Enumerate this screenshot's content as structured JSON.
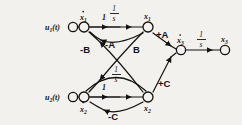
{
  "diagram": {
    "type": "signal-flow-graph",
    "background_color": "#f3f1ee",
    "ink_color": "#121212",
    "inputs": [
      {
        "id": "u1",
        "label": "u",
        "subscript": "1",
        "suffix": "(t)",
        "x": 70,
        "y": 27
      },
      {
        "id": "u2",
        "label": "u",
        "subscript": "2",
        "suffix": "(t)",
        "x": 70,
        "y": 97
      }
    ],
    "nodes": [
      {
        "id": "xd1",
        "label": "x",
        "subscript": "1",
        "dot": true,
        "x": 84,
        "y": 27,
        "label_pos": "above"
      },
      {
        "id": "x1",
        "label": "x",
        "subscript": "1",
        "dot": false,
        "x": 148,
        "y": 27,
        "label_pos": "above"
      },
      {
        "id": "xd2",
        "label": "x",
        "subscript": "2",
        "dot": true,
        "x": 84,
        "y": 97,
        "label_pos": "below"
      },
      {
        "id": "x2",
        "label": "x",
        "subscript": "2",
        "dot": false,
        "x": 148,
        "y": 97,
        "label_pos": "below"
      },
      {
        "id": "xd3",
        "label": "x",
        "subscript": "3",
        "dot": true,
        "x": 180,
        "y": 50,
        "label_pos": "above"
      },
      {
        "id": "x3",
        "label": "x",
        "subscript": "3",
        "dot": false,
        "x": 225,
        "y": 50,
        "label_pos": "above"
      }
    ],
    "edges": [
      {
        "id": "u1-xd1",
        "from": "u1",
        "to": "xd1",
        "gain": "1",
        "kind": "straight"
      },
      {
        "id": "u2-xd2",
        "from": "u2",
        "to": "xd2",
        "gain": "1",
        "kind": "straight"
      },
      {
        "id": "xd1-x1",
        "from": "xd1",
        "to": "x1",
        "gain": "1/s",
        "kind": "straight"
      },
      {
        "id": "xd2-x2",
        "from": "xd2",
        "to": "x2",
        "gain": "1/s",
        "kind": "straight"
      },
      {
        "id": "xd3-x3",
        "from": "xd3",
        "to": "x3",
        "gain": "1/s",
        "kind": "straight"
      },
      {
        "id": "x1-xd1",
        "from": "x1",
        "to": "xd1",
        "gain": "-A",
        "kind": "curve-above"
      },
      {
        "id": "x1-xd2",
        "from": "x1",
        "to": "xd2",
        "gain": "-B",
        "kind": "cross-down"
      },
      {
        "id": "x2-xd1",
        "from": "x2",
        "to": "xd1",
        "gain": "B",
        "kind": "cross-up"
      },
      {
        "id": "x2-xd2",
        "from": "x2",
        "to": "xd2",
        "gain": "-C",
        "kind": "curve-below"
      },
      {
        "id": "x1-xd3",
        "from": "x1",
        "to": "xd3",
        "gain": "+A",
        "kind": "diag-down"
      },
      {
        "id": "x2-xd3",
        "from": "x2",
        "to": "xd3",
        "gain": "+C",
        "kind": "diag-up"
      },
      {
        "id": "xd2-loop",
        "from": "xd2",
        "to": "xd2",
        "gain": "1/s",
        "kind": "arc-upper"
      }
    ],
    "gain_labels": [
      {
        "id": "g-u1",
        "text": "1",
        "x": 104,
        "y": 20
      },
      {
        "id": "g-u2",
        "text": "1",
        "x": 104,
        "y": 90
      },
      {
        "id": "g-s1",
        "text": "1/s",
        "x": 117,
        "y": 17
      },
      {
        "id": "g-s2",
        "text": "1/s",
        "x": 117,
        "y": 78
      },
      {
        "id": "g-s3",
        "text": "1/s",
        "x": 203,
        "y": 43
      },
      {
        "id": "g-negB",
        "text": "-B",
        "x": 88,
        "y": 50
      },
      {
        "id": "g-negA",
        "text": "-A",
        "x": 112,
        "y": 46
      },
      {
        "id": "g-posB",
        "text": "B",
        "x": 136,
        "y": 50
      },
      {
        "id": "g-posA",
        "text": "+A",
        "x": 160,
        "y": 38
      },
      {
        "id": "g-posC",
        "text": "+C",
        "x": 160,
        "y": 86
      },
      {
        "id": "g-negC",
        "text": "-C",
        "x": 114,
        "y": 114
      }
    ]
  }
}
